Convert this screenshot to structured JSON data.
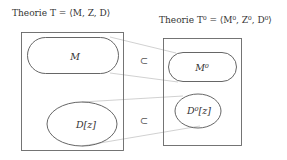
{
  "left_theory": {
    "title": "Theorie T = ⟨M, Z, D⟩",
    "set_m": "M",
    "set_d": "D[z]"
  },
  "right_theory": {
    "title": "Theorie T⁰ = ⟨M⁰, Z⁰, D⁰⟩",
    "set_m": "M⁰",
    "set_d": "D⁰[z]"
  },
  "relations": {
    "m_subset": "⊂",
    "d_subset": "⊂"
  },
  "colors": {
    "stroke": "#555555",
    "connector": "#bbbbbb"
  }
}
